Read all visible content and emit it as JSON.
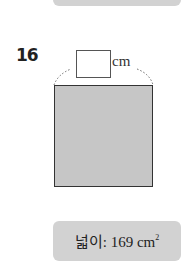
{
  "problem": {
    "number": "16",
    "side_unit": "cm",
    "side_answer": "",
    "area_label": "넓이: 169 cm",
    "area_exponent": "2"
  },
  "colors": {
    "shape_fill": "#c6c6c6",
    "box_fill": "#d2d2d2",
    "outline": "#333333"
  }
}
